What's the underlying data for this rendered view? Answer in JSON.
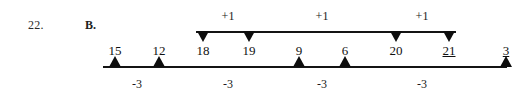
{
  "problem": {
    "number": "22.",
    "part": "B."
  },
  "diagram": {
    "type": "number-sequence-operation-diagram",
    "terms": [
      {
        "value": "15",
        "x": 115,
        "underlined": false,
        "marker": "up-triangle"
      },
      {
        "value": "12",
        "x": 159,
        "underlined": false,
        "marker": "up-triangle"
      },
      {
        "value": "18",
        "x": 203,
        "underlined": false,
        "marker": "down-triangle"
      },
      {
        "value": "19",
        "x": 249,
        "underlined": false,
        "marker": "down-triangle"
      },
      {
        "value": "9",
        "x": 299,
        "underlined": false,
        "marker": "up-triangle"
      },
      {
        "value": "6",
        "x": 345,
        "underlined": false,
        "marker": "up-triangle"
      },
      {
        "value": "20",
        "x": 396,
        "underlined": false,
        "marker": "down-triangle"
      },
      {
        "value": "21",
        "x": 449,
        "underlined": true,
        "marker": "down-triangle"
      },
      {
        "value": "3",
        "x": 506,
        "underlined": true,
        "marker": "up-triangle"
      }
    ],
    "top_operations": [
      {
        "label": "+1",
        "x": 228
      },
      {
        "label": "+1",
        "x": 322
      },
      {
        "label": "+1",
        "x": 422
      }
    ],
    "bottom_operations": [
      {
        "label": "-3",
        "x": 137
      },
      {
        "label": "-3",
        "x": 228
      },
      {
        "label": "-3",
        "x": 322
      },
      {
        "label": "-3",
        "x": 422
      }
    ],
    "colors": {
      "ink": "#141414",
      "marker": "#0d0d0d",
      "background": "#ffffff"
    }
  }
}
